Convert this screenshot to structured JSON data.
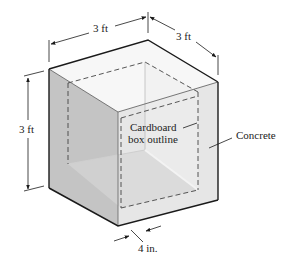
{
  "figure": {
    "dimensions": {
      "width_label": "3 ft",
      "depth_label": "3 ft",
      "height_label": "3 ft",
      "wall_thickness_label": "4 in."
    },
    "callouts": {
      "cardboard_line1": "Cardboard",
      "cardboard_line2": "box outline",
      "concrete": "Concrete"
    },
    "colors": {
      "outline": "#1a1a1a",
      "left_face": "#c4c4c4",
      "right_face": "#e6e6e6",
      "interior_floor": "#d4d4d4",
      "interior_back": "#ebebeb",
      "rim": "#f7f7f7",
      "dash": "#444444"
    }
  }
}
